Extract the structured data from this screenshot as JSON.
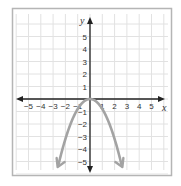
{
  "chart_data": {
    "type": "line",
    "title": "",
    "xlabel": "x",
    "ylabel": "y",
    "xlim": [
      -5.5,
      5.5
    ],
    "ylim": [
      -5.5,
      5.5
    ],
    "grid": true,
    "x_ticks": [
      "-5",
      "-4",
      "-3",
      "-2",
      "-1",
      "1",
      "2",
      "3",
      "4",
      "5"
    ],
    "y_ticks": [
      "5",
      "4",
      "3",
      "2",
      "1",
      "-1",
      "-2",
      "-3",
      "-4",
      "-5"
    ],
    "series": [
      {
        "name": "parabola",
        "equation": "y = -0.8x^2",
        "vertex": [
          0,
          0
        ],
        "opens": "down",
        "arrows_at_ends": true,
        "x": [
          -2.6,
          -2.5,
          -2,
          -1.5,
          -1,
          -0.5,
          0,
          0.5,
          1,
          1.5,
          2,
          2.5,
          2.6
        ],
        "y": [
          -5.41,
          -5,
          -3.2,
          -1.8,
          -0.8,
          -0.2,
          0,
          -0.2,
          -0.8,
          -1.8,
          -3.2,
          -5,
          -5.41
        ]
      }
    ],
    "legend": null
  },
  "colors": {
    "frame": "#b5b5b5",
    "grid": "#e2e2e2",
    "axis": "#222222",
    "curve": "#a3a3a3"
  },
  "axes": {
    "x_label": "x",
    "y_label": "y"
  }
}
